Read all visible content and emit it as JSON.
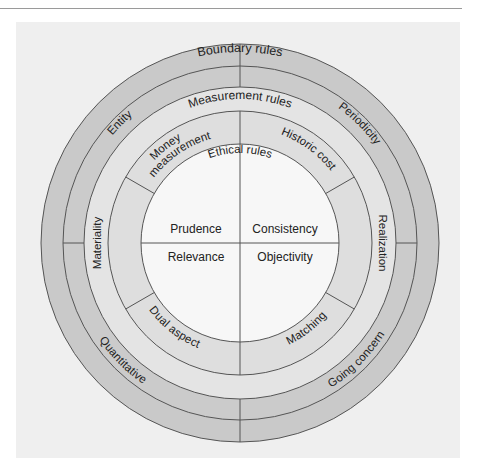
{
  "diagram": {
    "center": {
      "x": 240,
      "y": 243
    },
    "colors": {
      "background": "#efefef",
      "boundary_ring": "#c9c9c9",
      "measurement_ring": "#e2e2e2",
      "inner_ring": "#dedede",
      "ethical_core": "#f7f7f7",
      "stroke": "#555555"
    },
    "boundary_rules": {
      "label": "Boundary rules",
      "segments": [
        "Entity",
        "Periodicity",
        "Quantitative",
        "Going concern"
      ]
    },
    "measurement_rules": {
      "label": "Measurement rules",
      "segments": [
        "Money measurement",
        "Historic cost",
        "Realization",
        "Matching",
        "Dual aspect",
        "Materiality"
      ]
    },
    "ethical_rules": {
      "label": "Ethical rules",
      "quadrants": [
        "Prudence",
        "Consistency",
        "Relevance",
        "Objectivity"
      ]
    }
  },
  "labels": {
    "boundary": "Boundary rules",
    "entity": "Entity",
    "periodicity": "Periodicity",
    "quantitative": "Quantitative",
    "going_concern": "Going concern",
    "measurement": "Measurement rules",
    "money_1": "Money",
    "money_2": "measurement",
    "historic_cost": "Historic cost",
    "realization": "Realization",
    "matching": "Matching",
    "dual_aspect": "Dual aspect",
    "materiality": "Materiality",
    "ethical": "Ethical rules",
    "prudence": "Prudence",
    "consistency": "Consistency",
    "relevance": "Relevance",
    "objectivity": "Objectivity"
  }
}
